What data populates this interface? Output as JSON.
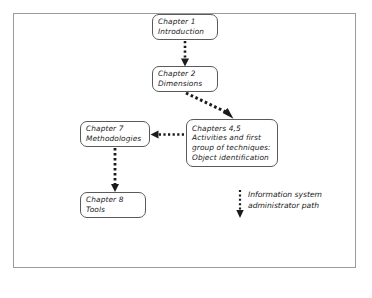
{
  "diagram": {
    "frame": {
      "border_color": "#9a9a9a",
      "background": "#ffffff"
    },
    "nodes": [
      {
        "id": "chapter-1",
        "lines": [
          "Chapter 1",
          "Introduction"
        ],
        "line1": "Chapter 1",
        "line2": "Introduction"
      },
      {
        "id": "chapter-2",
        "lines": [
          "Chapter 2",
          "Dimensions"
        ],
        "line1": "Chapter 2",
        "line2": "Dimensions"
      },
      {
        "id": "chapter-7",
        "lines": [
          "Chapter 7",
          "Methodologies"
        ],
        "line1": "Chapter 7",
        "line2": "Methodologies"
      },
      {
        "id": "chapters-4-5",
        "lines": [
          "Chapters 4,5",
          "Activities and first",
          "group of techniques:",
          "Object identification"
        ],
        "line1": "Chapters 4,5",
        "line2": "Activities and first",
        "line3": "group of techniques:",
        "line4": "Object identification"
      },
      {
        "id": "chapter-8",
        "lines": [
          "Chapter 8",
          "Tools"
        ],
        "line1": "Chapter 8",
        "line2": "Tools"
      }
    ],
    "edges": [
      {
        "id": "ch1-to-ch2",
        "from": "chapter-1",
        "to": "chapter-2",
        "style": "dotted",
        "direction": "down"
      },
      {
        "id": "ch2-to-ch45",
        "from": "chapter-2",
        "to": "chapters-4-5",
        "style": "dotted",
        "direction": "diagonal-down-right"
      },
      {
        "id": "ch45-to-ch7",
        "from": "chapters-4-5",
        "to": "chapter-7",
        "style": "dotted",
        "direction": "left"
      },
      {
        "id": "ch7-to-ch8",
        "from": "chapter-7",
        "to": "chapter-8",
        "style": "dotted",
        "direction": "down"
      }
    ],
    "legend": {
      "line1": "Information system",
      "line2": "administrator path",
      "marker_style": "dotted-arrow-down"
    },
    "colors": {
      "stroke": "#1b1b1b",
      "node_border": "#5a5a5a",
      "frame_border": "#9a9a9a",
      "text": "#1b1b1b",
      "background": "#ffffff"
    }
  }
}
